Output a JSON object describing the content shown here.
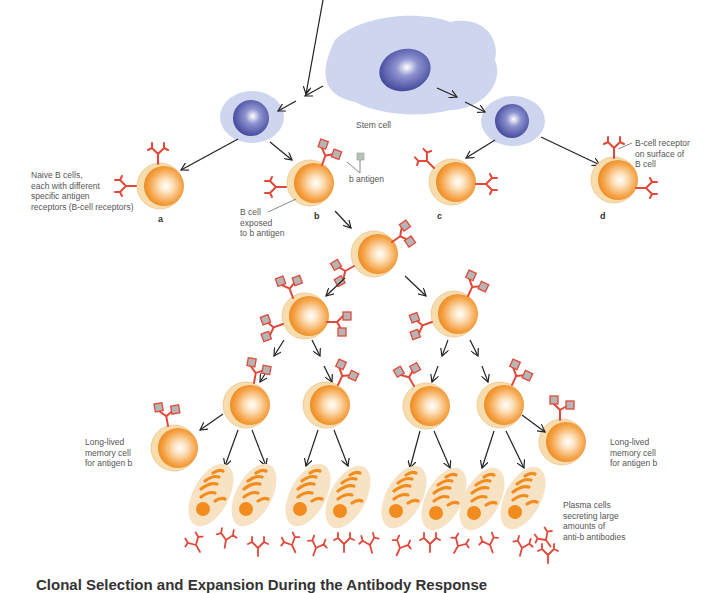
{
  "diagram": {
    "title_caption": "Clonal Selection and Expansion During the Antibody Response",
    "labels": {
      "stem_cell": "Stem cell",
      "naive_b_cells": "Naive B cells,\neach with different\nspecific antigen\nreceptors (B-cell receptors)",
      "b_antigen": "b antigen",
      "b_cell_exposed": "B cell\nexposed\nto b antigen",
      "bcr_on_surface": "B-cell receptor\non surface of\nB cell",
      "memory_left": "Long-lived\nmemory cell\nfor antigen b",
      "memory_right": "Long-lived\nmemory cell\nfor antigen b",
      "plasma_cells": "Plasma cells\nsecreting large\namounts of\nanti-b antibodies"
    },
    "cell_letters": [
      "a",
      "b",
      "c",
      "d"
    ],
    "colors": {
      "stem_cytoplasm": "#cdd6ee",
      "nucleus": "#4b52a6",
      "b_cell_outer": "#f6d7a4",
      "b_cell_body": "#f28c1e",
      "receptor": "#e0493a",
      "antigen": "#a9a9a9",
      "plasma_body": "#f7e3c4",
      "plasma_stripe": "#f28c1e",
      "arrow": "#222222",
      "label_text": "#555555"
    }
  }
}
